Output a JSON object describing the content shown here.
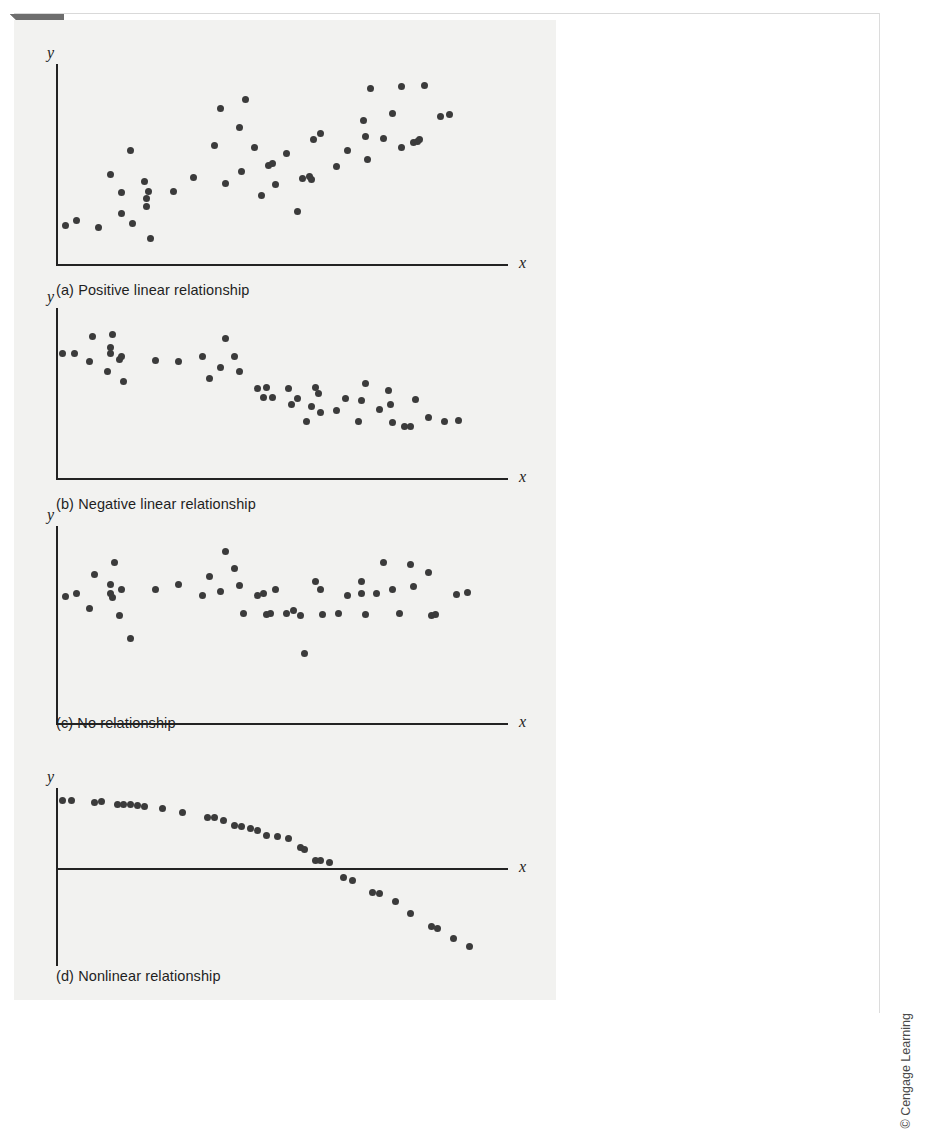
{
  "page": {
    "credit": "© Cengage Learning",
    "background_color": "#ffffff",
    "figure_tint": "#f2f2f0",
    "ink_color": "#232323",
    "dot_color": "#3b3b3b"
  },
  "chart_data": [
    {
      "type": "scatter",
      "id": "panel-a",
      "title": "(a) Positive linear relationship",
      "xlabel": "x",
      "ylabel": "y",
      "grid": false,
      "legend": null,
      "xlim": [
        0,
        100
      ],
      "ylim": [
        0,
        100
      ],
      "points": [
        [
          2.0,
          19.5
        ],
        [
          4.5,
          22.0
        ],
        [
          9.5,
          18.5
        ],
        [
          12.0,
          45.0
        ],
        [
          14.5,
          36.0
        ],
        [
          14.5,
          25.5
        ],
        [
          16.5,
          57.0
        ],
        [
          17.0,
          20.5
        ],
        [
          19.5,
          41.5
        ],
        [
          20.0,
          33.0
        ],
        [
          20.0,
          29.0
        ],
        [
          20.5,
          36.5
        ],
        [
          21.0,
          13.0
        ],
        [
          26.0,
          36.5
        ],
        [
          30.5,
          43.5
        ],
        [
          35.0,
          59.5
        ],
        [
          36.5,
          78.0
        ],
        [
          37.5,
          40.5
        ],
        [
          40.5,
          68.5
        ],
        [
          41.0,
          46.5
        ],
        [
          42.0,
          82.5
        ],
        [
          44.0,
          58.5
        ],
        [
          45.5,
          34.5
        ],
        [
          47.0,
          49.5
        ],
        [
          48.0,
          50.5
        ],
        [
          48.5,
          40.0
        ],
        [
          51.0,
          55.5
        ],
        [
          53.5,
          26.5
        ],
        [
          54.5,
          43.0
        ],
        [
          56.0,
          44.0
        ],
        [
          56.5,
          42.5
        ],
        [
          57.0,
          62.5
        ],
        [
          58.5,
          65.5
        ],
        [
          62.0,
          49.0
        ],
        [
          64.5,
          57.0
        ],
        [
          68.0,
          72.0
        ],
        [
          68.5,
          64.0
        ],
        [
          69.0,
          52.5
        ],
        [
          69.5,
          88.0
        ],
        [
          72.5,
          63.0
        ],
        [
          74.5,
          75.5
        ],
        [
          76.5,
          58.5
        ],
        [
          76.5,
          89.0
        ],
        [
          79.0,
          61.0
        ],
        [
          80.0,
          61.5
        ],
        [
          80.5,
          62.5
        ],
        [
          81.5,
          89.5
        ],
        [
          85.0,
          74.0
        ],
        [
          87.0,
          75.0
        ]
      ]
    },
    {
      "type": "scatter",
      "id": "panel-b",
      "title": "(b) Negative linear relationship",
      "xlabel": "x",
      "ylabel": "y",
      "grid": false,
      "legend": null,
      "xlim": [
        0,
        100
      ],
      "ylim": [
        0,
        100
      ],
      "points": [
        [
          1.5,
          73.0
        ],
        [
          4.0,
          73.5
        ],
        [
          8.0,
          83.0
        ],
        [
          7.5,
          68.5
        ],
        [
          12.5,
          84.5
        ],
        [
          12.0,
          76.5
        ],
        [
          12.0,
          73.0
        ],
        [
          11.5,
          62.5
        ],
        [
          14.0,
          70.0
        ],
        [
          14.5,
          71.5
        ],
        [
          15.0,
          57.0
        ],
        [
          22.0,
          69.0
        ],
        [
          27.0,
          68.5
        ],
        [
          32.5,
          71.5
        ],
        [
          34.0,
          58.5
        ],
        [
          36.5,
          65.0
        ],
        [
          37.5,
          82.0
        ],
        [
          39.5,
          71.5
        ],
        [
          40.5,
          62.5
        ],
        [
          44.5,
          52.5
        ],
        [
          46.0,
          47.5
        ],
        [
          46.5,
          53.0
        ],
        [
          48.0,
          47.5
        ],
        [
          51.5,
          52.5
        ],
        [
          52.0,
          43.5
        ],
        [
          53.5,
          47.0
        ],
        [
          55.5,
          33.0
        ],
        [
          56.5,
          42.0
        ],
        [
          57.5,
          53.5
        ],
        [
          58.0,
          49.5
        ],
        [
          58.5,
          38.5
        ],
        [
          62.0,
          39.5
        ],
        [
          64.0,
          46.5
        ],
        [
          67.5,
          45.5
        ],
        [
          67.0,
          33.0
        ],
        [
          68.5,
          55.5
        ],
        [
          71.5,
          40.5
        ],
        [
          73.5,
          51.5
        ],
        [
          74.0,
          43.0
        ],
        [
          74.5,
          32.5
        ],
        [
          77.0,
          30.5
        ],
        [
          78.5,
          30.5
        ],
        [
          79.5,
          46.0
        ],
        [
          82.5,
          35.5
        ],
        [
          86.0,
          33.5
        ],
        [
          89.0,
          34.0
        ]
      ]
    },
    {
      "type": "scatter",
      "id": "panel-c",
      "title": "(c) No relationship",
      "xlabel": "x",
      "ylabel": "y",
      "grid": false,
      "legend": null,
      "xlim": [
        0,
        100
      ],
      "ylim": [
        0,
        100
      ],
      "points": [
        [
          2.0,
          64.0
        ],
        [
          4.5,
          65.5
        ],
        [
          8.5,
          75.5
        ],
        [
          7.5,
          58.0
        ],
        [
          13.0,
          81.5
        ],
        [
          12.0,
          70.5
        ],
        [
          12.0,
          65.5
        ],
        [
          12.5,
          63.5
        ],
        [
          14.5,
          68.0
        ],
        [
          14.0,
          54.5
        ],
        [
          16.5,
          43.0
        ],
        [
          22.0,
          68.0
        ],
        [
          27.0,
          70.5
        ],
        [
          32.5,
          64.5
        ],
        [
          34.0,
          74.5
        ],
        [
          36.5,
          67.0
        ],
        [
          37.5,
          87.0
        ],
        [
          39.5,
          78.5
        ],
        [
          40.5,
          70.0
        ],
        [
          41.5,
          55.5
        ],
        [
          44.5,
          64.5
        ],
        [
          46.0,
          65.5
        ],
        [
          46.5,
          55.0
        ],
        [
          47.5,
          55.5
        ],
        [
          48.5,
          68.0
        ],
        [
          51.0,
          55.5
        ],
        [
          52.5,
          57.0
        ],
        [
          54.0,
          54.5
        ],
        [
          55.0,
          35.5
        ],
        [
          57.5,
          72.0
        ],
        [
          58.5,
          68.0
        ],
        [
          59.0,
          55.0
        ],
        [
          62.5,
          55.5
        ],
        [
          64.5,
          64.5
        ],
        [
          67.5,
          72.0
        ],
        [
          67.5,
          65.5
        ],
        [
          68.5,
          55.0
        ],
        [
          71.0,
          65.5
        ],
        [
          72.5,
          81.5
        ],
        [
          74.5,
          68.0
        ],
        [
          76.0,
          55.5
        ],
        [
          78.5,
          80.5
        ],
        [
          79.0,
          69.5
        ],
        [
          82.5,
          76.5
        ],
        [
          83.0,
          54.5
        ],
        [
          84.0,
          55.0
        ],
        [
          88.5,
          65.0
        ],
        [
          91.0,
          66.0
        ]
      ]
    },
    {
      "type": "scatter",
      "id": "panel-d",
      "title": "(d) Nonlinear relationship",
      "xlabel": "x",
      "ylabel": "y",
      "grid": false,
      "legend": null,
      "xlim": [
        0,
        100
      ],
      "ylim": [
        -55,
        45
      ],
      "zero_line": true,
      "points": [
        [
          1.5,
          38.0
        ],
        [
          3.5,
          38.0
        ],
        [
          8.5,
          37.0
        ],
        [
          10.0,
          37.5
        ],
        [
          13.5,
          36.0
        ],
        [
          15.0,
          35.5
        ],
        [
          16.5,
          35.5
        ],
        [
          18.0,
          35.0
        ],
        [
          19.5,
          34.5
        ],
        [
          23.5,
          33.5
        ],
        [
          28.0,
          31.5
        ],
        [
          33.5,
          28.5
        ],
        [
          35.0,
          28.5
        ],
        [
          37.0,
          26.5
        ],
        [
          39.5,
          24.0
        ],
        [
          41.0,
          23.5
        ],
        [
          43.0,
          22.5
        ],
        [
          44.5,
          21.0
        ],
        [
          46.5,
          18.5
        ],
        [
          49.0,
          17.5
        ],
        [
          51.5,
          16.5
        ],
        [
          54.0,
          11.5
        ],
        [
          55.0,
          10.5
        ],
        [
          57.5,
          4.5
        ],
        [
          58.5,
          4.0
        ],
        [
          60.5,
          3.0
        ],
        [
          63.5,
          -5.5
        ],
        [
          65.5,
          -7.0
        ],
        [
          70.0,
          -13.5
        ],
        [
          71.5,
          -14.5
        ],
        [
          75.0,
          -19.0
        ],
        [
          78.5,
          -25.5
        ],
        [
          83.0,
          -33.0
        ],
        [
          84.5,
          -34.0
        ],
        [
          88.0,
          -39.5
        ],
        [
          91.5,
          -44.0
        ]
      ]
    }
  ],
  "panels": [
    {
      "id": "panel-a",
      "caption": "(a) Positive linear relationship",
      "x_axis_label": "x",
      "y_axis_label": "y"
    },
    {
      "id": "panel-b",
      "caption": "(b) Negative linear relationship",
      "x_axis_label": "x",
      "y_axis_label": "y"
    },
    {
      "id": "panel-c",
      "caption": "(c) No relationship",
      "x_axis_label": "x",
      "y_axis_label": "y"
    },
    {
      "id": "panel-d",
      "caption": "(d) Nonlinear relationship",
      "x_axis_label": "x",
      "y_axis_label": "y"
    }
  ],
  "layout": {
    "panels": [
      {
        "top": 28,
        "plot_left": 42,
        "plot_top": 16,
        "plot_width": 452,
        "plot_height": 200,
        "caption_top": 234,
        "axis_mode": "corner"
      },
      {
        "top": 272,
        "plot_left": 42,
        "plot_top": 16,
        "plot_width": 452,
        "plot_height": 170,
        "caption_top": 204,
        "axis_mode": "corner"
      },
      {
        "top": 490,
        "plot_left": 42,
        "plot_top": 16,
        "plot_width": 452,
        "plot_height": 197,
        "caption_top": 205,
        "axis_mode": "corner"
      },
      {
        "top": 752,
        "plot_left": 42,
        "plot_top": 16,
        "plot_width": 452,
        "plot_height": 178,
        "caption_top": 196,
        "axis_mode": "zero"
      }
    ]
  }
}
